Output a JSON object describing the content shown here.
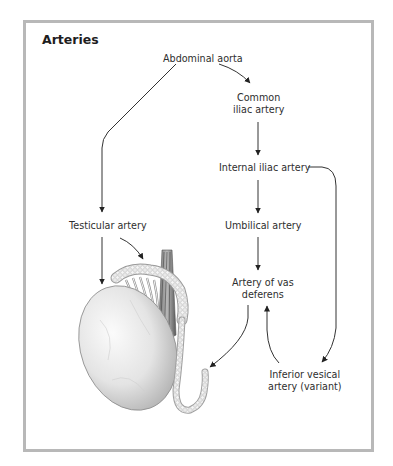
{
  "diagram": {
    "title": "Arteries",
    "nodes": [
      {
        "id": "abdominal-aorta",
        "label": "Abdominal aorta"
      },
      {
        "id": "common-iliac",
        "label_line1": "Common",
        "label_line2": "iliac artery"
      },
      {
        "id": "internal-iliac",
        "label": "Internal iliac artery"
      },
      {
        "id": "umbilical",
        "label": "Umbilical artery"
      },
      {
        "id": "vas-deferens",
        "label_line1": "Artery of vas",
        "label_line2": "deferens"
      },
      {
        "id": "testicular",
        "label": "Testicular artery"
      },
      {
        "id": "inferior-vesical",
        "label_line1": "Inferior vesical",
        "label_line2": "artery (variant)"
      }
    ],
    "edges": [
      {
        "from": "Abdominal aorta",
        "to": "Common iliac artery"
      },
      {
        "from": "Abdominal aorta",
        "to": "Testicular artery"
      },
      {
        "from": "Common iliac artery",
        "to": "Internal iliac artery"
      },
      {
        "from": "Internal iliac artery",
        "to": "Umbilical artery"
      },
      {
        "from": "Umbilical artery",
        "to": "Artery of vas deferens"
      },
      {
        "from": "Internal iliac artery",
        "to": "Inferior vesical artery (variant)"
      },
      {
        "from": "Inferior vesical artery (variant)",
        "to": "Artery of vas deferens"
      },
      {
        "from": "Artery of vas deferens",
        "to": "ductus deferens (illustration)"
      },
      {
        "from": "Testicular artery",
        "to": "testis (illustration)"
      },
      {
        "from": "Testicular artery",
        "to": "epididymis (illustration)"
      }
    ],
    "illustration": "testis-with-epididymis-and-ductus-deferens",
    "colors": {
      "frame": "#b8b8b8",
      "line": "#333333",
      "text": "#2e2e2e"
    }
  }
}
